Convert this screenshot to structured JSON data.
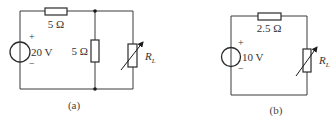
{
  "circuits": [
    {
      "id": "a",
      "caption": "(a)",
      "source": {
        "voltage_label": "20 V",
        "plus": "+",
        "minus": "−"
      },
      "series_resistor": {
        "label": "5 Ω"
      },
      "shunt_resistor": {
        "label": "5 Ω"
      },
      "load_resistor": {
        "label_main": "R",
        "label_sub": "L",
        "variable": true
      }
    },
    {
      "id": "b",
      "caption": "(b)",
      "source": {
        "voltage_label": "10 V",
        "plus": "+",
        "minus": "−"
      },
      "series_resistor": {
        "label": "2.5 Ω"
      },
      "load_resistor": {
        "label_main": "R",
        "label_sub": "L",
        "variable": true
      }
    }
  ],
  "colors": {
    "wire": "#3a3a3a",
    "text": "#333333",
    "background": "#ffffff"
  }
}
